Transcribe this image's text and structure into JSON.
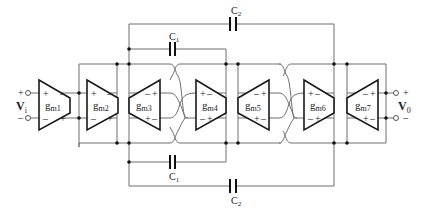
{
  "diagram": {
    "type": "circuit-schematic",
    "input": {
      "label": "V",
      "subscript": "i",
      "plus": "+",
      "minus": "–"
    },
    "output": {
      "label": "V",
      "subscript": "0",
      "plus": "+",
      "minus": "–"
    },
    "transconductors": [
      {
        "id": "gm1",
        "label": "g",
        "subscript": "m1",
        "direction": "right",
        "signs_in": [
          "+",
          "–"
        ],
        "signs_out": [
          "–",
          "+"
        ]
      },
      {
        "id": "gm2",
        "label": "g",
        "subscript": "m2",
        "direction": "right",
        "signs_in": [
          "+",
          "–"
        ],
        "signs_out": [
          "–",
          "+"
        ]
      },
      {
        "id": "gm3",
        "label": "g",
        "subscript": "m3",
        "direction": "left",
        "signs_in": [
          "–",
          "+"
        ],
        "signs_out": [
          "+",
          "–"
        ]
      },
      {
        "id": "gm4",
        "label": "g",
        "subscript": "m4",
        "direction": "right",
        "signs_in": [
          "+",
          "–"
        ],
        "signs_out": [
          "–",
          "+"
        ]
      },
      {
        "id": "gm5",
        "label": "g",
        "subscript": "m5",
        "direction": "left",
        "signs_in": [
          "–",
          "+"
        ],
        "signs_out": [
          "+",
          "–"
        ]
      },
      {
        "id": "gm6",
        "label": "g",
        "subscript": "m6",
        "direction": "right",
        "signs_in": [
          "+",
          "–"
        ],
        "signs_out": [
          "–",
          "+"
        ]
      },
      {
        "id": "gm7",
        "label": "g",
        "subscript": "m7",
        "direction": "left",
        "signs_in": [
          "–",
          "+"
        ],
        "signs_out": [
          "+",
          "–"
        ]
      }
    ],
    "capacitors": [
      {
        "id": "c1-top",
        "label": "C",
        "subscript": "1"
      },
      {
        "id": "c2-top",
        "label": "C",
        "subscript": "2"
      },
      {
        "id": "c1-bottom",
        "label": "C",
        "subscript": "1"
      },
      {
        "id": "c2-bottom",
        "label": "C",
        "subscript": "2"
      }
    ]
  }
}
